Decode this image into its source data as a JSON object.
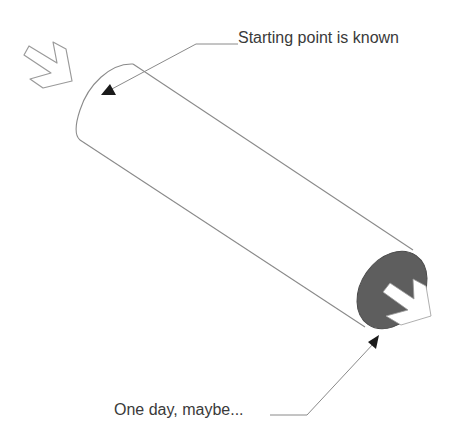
{
  "diagram": {
    "type": "cylinder-pipe-illustration",
    "colors": {
      "outline": "#8a8a8a",
      "end_cap_fill": "#5e5e5e",
      "arrow_fill_inside_cap": "#ffffff",
      "callout_line": "#8a8a8a",
      "arrowhead": "#1a1a1a",
      "text": "#3a3a3a"
    },
    "icons": {
      "entry_arrow": "open-chevron-arrow-outline",
      "exit_arrow": "white-chevron-arrow-on-dark-cap"
    },
    "callouts": [
      {
        "id": "start",
        "label": "Starting point is known"
      },
      {
        "id": "end",
        "label": "One day, maybe..."
      }
    ]
  }
}
